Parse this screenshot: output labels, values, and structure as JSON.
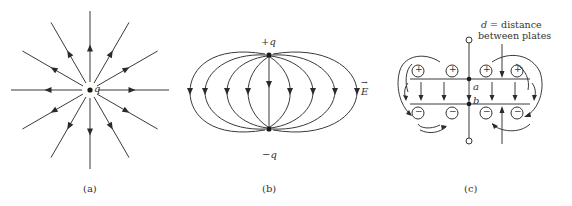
{
  "panels": [
    {
      "id": "a",
      "caption": "(a)",
      "description": "Radial field lines of a point charge",
      "charge_label": "q",
      "num_field_lines": 12,
      "arrow_direction": "outward"
    },
    {
      "id": "b",
      "caption": "(b)",
      "description": "Field lines between positive and negative point charges (dipole)",
      "top_charge_label": "+q",
      "bottom_charge_label": "−q",
      "field_label": "E",
      "field_vector_arrow": "→",
      "arrow_direction": "downward (from +q to −q)"
    },
    {
      "id": "c",
      "caption": "(c)",
      "description": "Parallel-plate capacitor with uniform field between plates and fringing field at edges",
      "distance_label_line1": "d = distance",
      "distance_label_var": "d",
      "distance_label_rest": " = distance",
      "distance_label_line2": "between plates",
      "point_a_label": "a",
      "point_b_label": "b",
      "plus_symbol": "+",
      "minus_symbol": "−",
      "plus_charges": 4,
      "minus_charges": 4
    }
  ]
}
